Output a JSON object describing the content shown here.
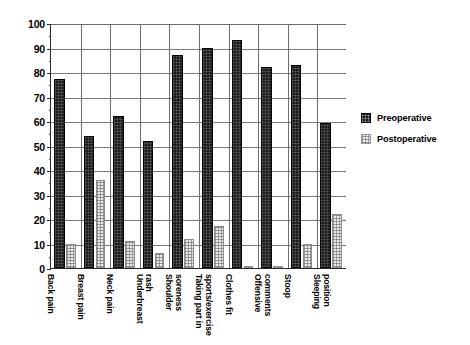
{
  "chart_data": {
    "type": "bar",
    "title": "",
    "subtitle": "",
    "xlabel": "",
    "ylabel": "",
    "ylim": [
      0,
      100
    ],
    "ytick_step": 10,
    "yticks": [
      0,
      10,
      20,
      30,
      40,
      50,
      60,
      70,
      80,
      90,
      100
    ],
    "grid": true,
    "legend_position": "right",
    "categories": [
      "Back pain",
      "Breast pain",
      "Neck pain",
      "Underbreast rash",
      "Shoulder soreness",
      "Taking part in sports/exercise",
      "Clothes fit",
      "Offensive comments",
      "Stoop",
      "Sleeping position"
    ],
    "category_lines": [
      [
        "Back pain"
      ],
      [
        "Breast pain"
      ],
      [
        "Neck pain"
      ],
      [
        "Underbreast",
        "rash"
      ],
      [
        "Shoulder",
        "soreness"
      ],
      [
        "Taking part in",
        "sports/exercise"
      ],
      [
        "Clothes fit"
      ],
      [
        "Offensive",
        "comments"
      ],
      [
        "Stoop"
      ],
      [
        "Sleeping",
        "position"
      ]
    ],
    "series": [
      {
        "name": "Preoperative",
        "color": "#1b1b1b",
        "values": [
          77,
          54,
          62,
          52,
          87,
          90,
          93,
          82,
          83,
          59
        ]
      },
      {
        "name": "Postoperative",
        "color": "#e9e9e9",
        "values": [
          10,
          36,
          11,
          6,
          12,
          17,
          1,
          1,
          10,
          22
        ]
      }
    ]
  },
  "legend": {
    "items": [
      {
        "label": "Preoperative"
      },
      {
        "label": "Postoperative"
      }
    ]
  }
}
